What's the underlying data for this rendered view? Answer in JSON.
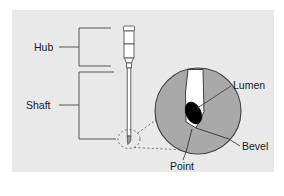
{
  "figure": {
    "name": "hypodermic-needle-anatomy",
    "background_color": "#ffffff",
    "panel_color": "#e8e8e8",
    "line_color": "#4a4a4a",
    "bevel_color": "#a8a8a8",
    "lumen_color": "#ffffff",
    "opening_color": "#000000",
    "text_color": "#1a1a1a"
  },
  "labels": {
    "hub": "Hub",
    "shaft": "Shaft",
    "lumen": "Lumen",
    "bevel": "Bevel",
    "point": "Point"
  },
  "parts": {
    "needle": "needle-assembly",
    "hub_bracket": "hub-bracket",
    "shaft_bracket": "shaft-bracket",
    "magnifier": "magnified-tip-circle",
    "callout": "dashed-callout"
  }
}
